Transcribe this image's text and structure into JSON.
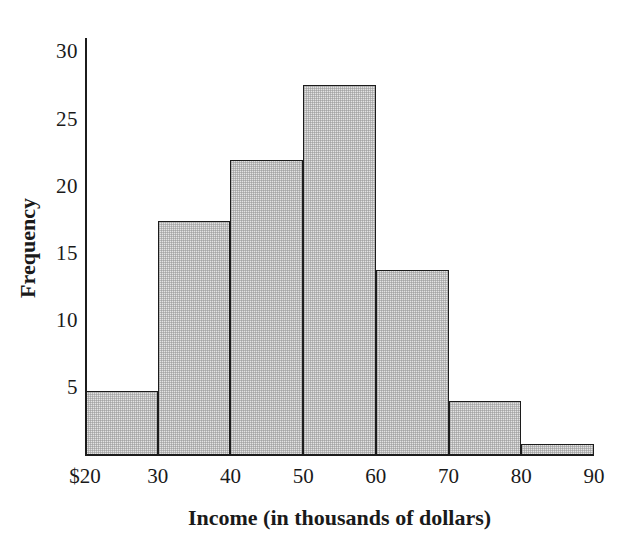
{
  "chart_data": {
    "type": "bar",
    "title": "",
    "subtitle": "",
    "xlabel": "Income (in thousands of dollars)",
    "ylabel": "Frequency",
    "categories": [
      "20-30",
      "30-40",
      "40-50",
      "50-60",
      "60-70",
      "70-80",
      "80-90"
    ],
    "bin_edges": [
      20,
      30,
      40,
      50,
      60,
      70,
      80,
      90
    ],
    "values": [
      4.8,
      17.4,
      22.0,
      27.6,
      13.8,
      4.0,
      0.8
    ],
    "x": [
      20,
      30,
      40,
      50,
      60,
      70,
      80,
      90
    ],
    "xtick_labels": [
      "$20",
      "30",
      "40",
      "50",
      "60",
      "70",
      "80",
      "90"
    ],
    "ytick_labels": [
      "5",
      "10",
      "15",
      "20",
      "25",
      "30"
    ],
    "ytick_values": [
      5,
      10,
      15,
      20,
      25,
      30
    ],
    "xlim": [
      20,
      90
    ],
    "ylim": [
      0,
      30
    ],
    "grid": false,
    "legend": null,
    "bar_fill_color": "#e3e3e3",
    "bar_edge_color": "#1c1c1c",
    "axis_color": "#1c1c1c",
    "background_color": "#ffffff"
  },
  "axes": {
    "y_title": "Frequency",
    "x_title": "Income (in thousands of dollars)"
  },
  "yticks": [
    {
      "label": "30",
      "value": 30
    },
    {
      "label": "25",
      "value": 25
    },
    {
      "label": "20",
      "value": 20
    },
    {
      "label": "15",
      "value": 15
    },
    {
      "label": "10",
      "value": 10
    },
    {
      "label": "5",
      "value": 5
    }
  ],
  "xticks": [
    {
      "label": "$20",
      "value": 20
    },
    {
      "label": "30",
      "value": 30
    },
    {
      "label": "40",
      "value": 40
    },
    {
      "label": "50",
      "value": 50
    },
    {
      "label": "60",
      "value": 60
    },
    {
      "label": "70",
      "value": 70
    },
    {
      "label": "80",
      "value": 80
    },
    {
      "label": "90",
      "value": 90
    }
  ],
  "bars": [
    {
      "name": "bin-20-30",
      "low": 20,
      "high": 30,
      "value": 4.8
    },
    {
      "name": "bin-30-40",
      "low": 30,
      "high": 40,
      "value": 17.4
    },
    {
      "name": "bin-40-50",
      "low": 40,
      "high": 50,
      "value": 22.0
    },
    {
      "name": "bin-50-60",
      "low": 50,
      "high": 60,
      "value": 27.6
    },
    {
      "name": "bin-60-70",
      "low": 60,
      "high": 70,
      "value": 13.8
    },
    {
      "name": "bin-70-80",
      "low": 70,
      "high": 80,
      "value": 4.0
    },
    {
      "name": "bin-80-90",
      "low": 80,
      "high": 90,
      "value": 0.8
    }
  ]
}
